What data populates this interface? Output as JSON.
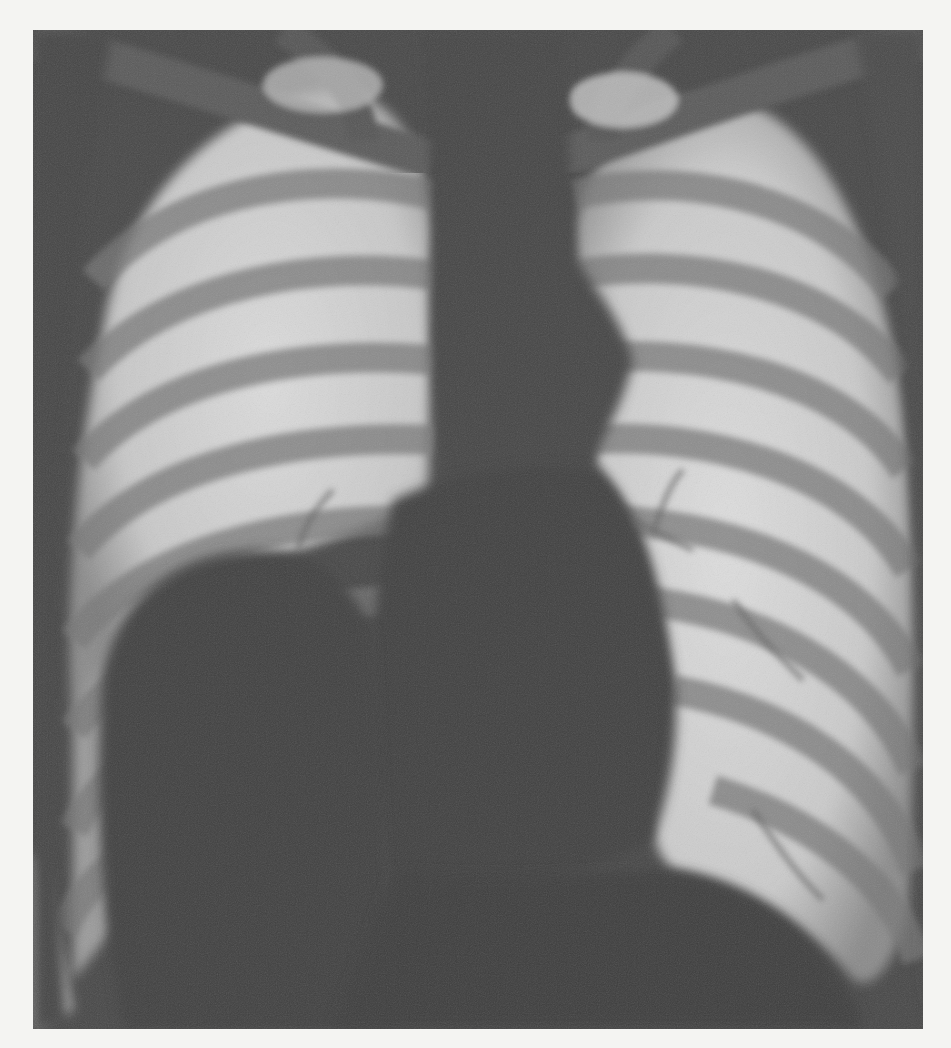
{
  "image": {
    "subject": "Frontal chest radiograph (PA view), grayscale",
    "alt_text": "Chest X-ray showing ribs, lung fields, central mediastinum and heart shadow, diaphragm domes",
    "frame": {
      "x": 33,
      "y": 30,
      "width": 890,
      "height": 999
    },
    "colors": {
      "page_background": "#f4f4f2",
      "soft_tissue_dark": "#3f3f3f",
      "mediastinum": "#454545",
      "lung_field_bright": "#d6d6d6",
      "rib_band": "#7c7c7c"
    },
    "regions": [
      {
        "name": "right-lung-field",
        "side": "image-left"
      },
      {
        "name": "left-lung-field",
        "side": "image-right"
      },
      {
        "name": "mediastinum",
        "side": "center"
      },
      {
        "name": "heart-shadow",
        "side": "center-right"
      },
      {
        "name": "right-hemidiaphragm-dome",
        "side": "image-left"
      },
      {
        "name": "left-hemidiaphragm-dome",
        "side": "image-right"
      },
      {
        "name": "clavicles",
        "side": "top"
      }
    ]
  }
}
